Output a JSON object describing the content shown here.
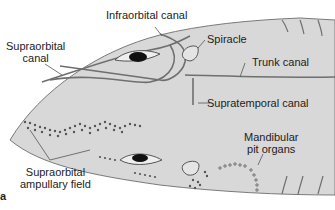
{
  "figure": {
    "panel_letter": "a",
    "colors": {
      "skin": "#d8d8d8",
      "canal": "#6f6f6f",
      "outline": "#555555",
      "dots": "#555555",
      "eye": "#111111"
    }
  },
  "labels": {
    "infraorbital_canal": "Infraorbital canal",
    "supraorbital_canal_line1": "Supraorbital",
    "supraorbital_canal_line2": "canal",
    "spiracle": "Spiracle",
    "trunk_canal": "Trunk canal",
    "supratemporal_canal": "Supratemporal canal",
    "mandibular_line1": "Mandibular",
    "mandibular_line2": "pit organs",
    "ampullary_line1": "Supraorbital",
    "ampullary_line2": "ampullary field"
  }
}
